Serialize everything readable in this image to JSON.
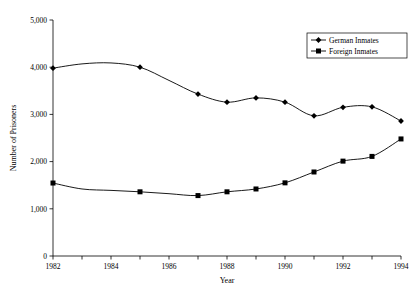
{
  "chart_data": {
    "type": "line",
    "title": "",
    "xlabel": "Year",
    "ylabel": "Number of Prisoners",
    "x": [
      1982,
      1983,
      1984,
      1985,
      1986,
      1987,
      1988,
      1989,
      1990,
      1991,
      1992,
      1993,
      1994
    ],
    "xlim": [
      1982,
      1994
    ],
    "ylim": [
      0,
      5000
    ],
    "xticks": [
      1982,
      1983,
      1984,
      1985,
      1986,
      1987,
      1988,
      1989,
      1990,
      1991,
      1992,
      1993,
      1994
    ],
    "xtick_labels": [
      "1982",
      "",
      "1984",
      "",
      "1986",
      "",
      "1988",
      "",
      "1990",
      "",
      "1992",
      "",
      "1994"
    ],
    "yticks": [
      0,
      1000,
      2000,
      3000,
      4000,
      5000
    ],
    "ytick_labels": [
      "0",
      "1,000",
      "2,000",
      "3,000",
      "4,000",
      "5,000"
    ],
    "grid": false,
    "legend_position": "top-right",
    "series": [
      {
        "name": "German Inmates",
        "marker": "diamond",
        "color": "#000000",
        "values": [
          3980,
          4070,
          4090,
          4000,
          3720,
          3430,
          3260,
          3350,
          3260,
          2970,
          3150,
          3160,
          2860
        ],
        "marker_years": [
          1982,
          1985,
          1987,
          1988,
          1989,
          1990,
          1991,
          1992,
          1993,
          1994
        ]
      },
      {
        "name": "Foreign Inmates",
        "marker": "square",
        "color": "#000000",
        "values": [
          1546,
          1420,
          1390,
          1360,
          1320,
          1280,
          1360,
          1420,
          1550,
          1780,
          2010,
          2110,
          2480
        ],
        "marker_years": [
          1982,
          1985,
          1987,
          1988,
          1989,
          1990,
          1991,
          1992,
          1993,
          1994
        ]
      }
    ]
  },
  "legend": {
    "entries": [
      {
        "label": "German Inmates"
      },
      {
        "label": "Foreign Inmates"
      }
    ]
  },
  "axes": {
    "x_title": "Year",
    "y_title": "Number of Prisoners"
  }
}
